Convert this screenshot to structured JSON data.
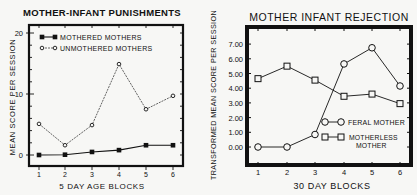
{
  "chart_data": [
    {
      "type": "line",
      "title": "MOTHER-INFANT PUNISHMENTS",
      "xlabel": "5 DAY AGE BLOCKS",
      "ylabel": "MEAN SCORE PER SESSION",
      "categories": [
        "1",
        "2",
        "3",
        "4",
        "5",
        "6"
      ],
      "ylim": [
        0,
        20
      ],
      "yticks": [
        "0",
        "10",
        "20"
      ],
      "grid": false,
      "legend_position": "upper left",
      "series": [
        {
          "name": "MOTHERED MOTHERS",
          "marker": "filled-square",
          "line": "solid",
          "values": [
            0.0,
            0.05,
            0.5,
            0.8,
            1.6,
            1.6
          ]
        },
        {
          "name": "UNMOTHERED MOTHERS",
          "marker": "open-circle",
          "line": "dashed",
          "values": [
            5.1,
            1.6,
            4.9,
            14.9,
            7.5,
            9.7
          ]
        }
      ]
    },
    {
      "type": "line",
      "title": "MOTHER INFANT REJECTION",
      "xlabel": "30 DAY BLOCKS",
      "ylabel": "TRANSFORMED MEAN SCORE PER SESSION",
      "categories": [
        "1",
        "2",
        "3",
        "4",
        "5",
        "6"
      ],
      "ylim": [
        0,
        7.5
      ],
      "yticks": [
        "0.00",
        "1.00",
        "2.00",
        "3.00",
        "4.00",
        "5.00",
        "6.00",
        "7.00"
      ],
      "grid": false,
      "legend_position": "lower right",
      "series": [
        {
          "name": "FERAL MOTHER",
          "marker": "open-circle",
          "line": "solid",
          "values": [
            0.0,
            0.0,
            0.85,
            5.65,
            6.75,
            4.15
          ]
        },
        {
          "name": "MOTHERLESS MOTHER",
          "marker": "open-square",
          "line": "solid",
          "values": [
            4.65,
            5.5,
            4.55,
            3.45,
            3.6,
            2.95
          ]
        }
      ]
    }
  ]
}
